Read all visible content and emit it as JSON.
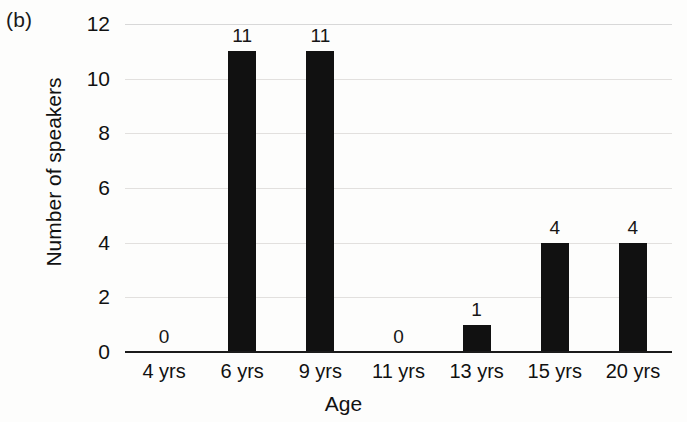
{
  "panel": {
    "label": "(b)"
  },
  "chart_data": {
    "type": "bar",
    "title": "",
    "panel_label": "(b)",
    "xlabel": "Age",
    "ylabel": "Number of speakers",
    "categories": [
      "4 yrs",
      "6 yrs",
      "9 yrs",
      "11 yrs",
      "13 yrs",
      "15 yrs",
      "20 yrs"
    ],
    "values": [
      0,
      11,
      11,
      0,
      1,
      4,
      4
    ],
    "data_labels": [
      "0",
      "11",
      "11",
      "0",
      "1",
      "4",
      "4"
    ],
    "ylim": [
      0,
      12
    ],
    "yticks": [
      0,
      2,
      4,
      6,
      8,
      10,
      12
    ],
    "ytick_labels": [
      "0",
      "2",
      "4",
      "6",
      "8",
      "10",
      "12"
    ],
    "grid": true,
    "grid_axis": "y",
    "legend": null,
    "bar_color": "#111111",
    "grid_color": "#dcdad8",
    "axis_color": "#1b1b1b",
    "background_color": "#fdfdfc"
  }
}
